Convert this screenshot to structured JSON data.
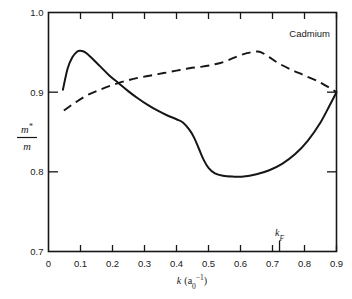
{
  "chart_data": {
    "type": "line",
    "title": "",
    "annotation": "Cadmium",
    "xlabel": "k (a₀⁻¹)",
    "ylabel": "m*/m",
    "ylabel_numerator": "m",
    "ylabel_numerator_star": "*",
    "ylabel_denominator": "m",
    "xlim": [
      0.0,
      0.9
    ],
    "ylim": [
      0.7,
      1.0
    ],
    "grid": false,
    "legend": "none",
    "xticks": [
      0.0,
      0.1,
      0.2,
      0.3,
      0.4,
      0.5,
      0.6,
      0.7,
      0.8,
      0.9
    ],
    "xtick_labels": [
      "0",
      "0.1",
      "0.2",
      "0.3",
      "0.4",
      "0.5",
      "0.6",
      "0.7",
      "0.8",
      "0.9"
    ],
    "yticks": [
      0.7,
      0.8,
      0.9,
      1.0
    ],
    "ytick_labels": [
      "0.7",
      "0.8",
      "0.9",
      "1.0"
    ],
    "markers": [
      {
        "name": "k_F",
        "label": "k",
        "sublabel": "F",
        "x": 0.722,
        "axis": "x"
      }
    ],
    "series": [
      {
        "name": "solid-curve",
        "style": "solid",
        "color": "#161616",
        "x": [
          0.045,
          0.06,
          0.075,
          0.09,
          0.1,
          0.115,
          0.135,
          0.16,
          0.19,
          0.22,
          0.25,
          0.28,
          0.31,
          0.34,
          0.37,
          0.4,
          0.42,
          0.44,
          0.455,
          0.47,
          0.485,
          0.5,
          0.52,
          0.545,
          0.575,
          0.61,
          0.65,
          0.69,
          0.73,
          0.77,
          0.81,
          0.85,
          0.878,
          0.9
        ],
        "y": [
          0.903,
          0.93,
          0.944,
          0.951,
          0.952,
          0.95,
          0.943,
          0.933,
          0.921,
          0.911,
          0.901,
          0.892,
          0.884,
          0.877,
          0.871,
          0.866,
          0.862,
          0.853,
          0.843,
          0.829,
          0.815,
          0.805,
          0.798,
          0.795,
          0.794,
          0.794,
          0.797,
          0.802,
          0.81,
          0.822,
          0.839,
          0.862,
          0.883,
          0.9
        ]
      },
      {
        "name": "dashed-curve",
        "style": "dashed",
        "color": "#161616",
        "x": [
          0.048,
          0.08,
          0.12,
          0.16,
          0.2,
          0.24,
          0.28,
          0.32,
          0.36,
          0.4,
          0.44,
          0.48,
          0.52,
          0.555,
          0.59,
          0.62,
          0.65,
          0.665,
          0.69,
          0.72,
          0.76,
          0.8,
          0.845,
          0.88,
          0.9
        ],
        "y": [
          0.877,
          0.886,
          0.896,
          0.903,
          0.909,
          0.914,
          0.918,
          0.921,
          0.924,
          0.927,
          0.93,
          0.932,
          0.935,
          0.939,
          0.945,
          0.949,
          0.951,
          0.95,
          0.944,
          0.936,
          0.928,
          0.921,
          0.913,
          0.905,
          0.9
        ]
      }
    ]
  }
}
